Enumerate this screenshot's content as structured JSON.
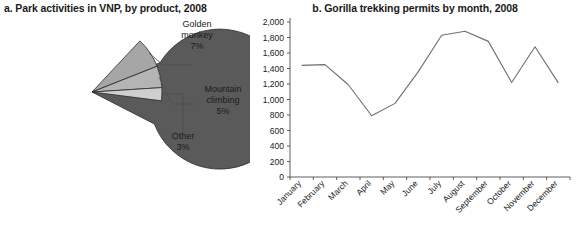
{
  "chart_data": [
    {
      "type": "pie",
      "title": "a. Park activities in VNP, by product, 2008",
      "labels": [
        "Gorilla",
        "Golden monkey",
        "Mountain climbing",
        "Other"
      ],
      "values": [
        85,
        7,
        5,
        3
      ],
      "value_labels": [
        "85%",
        "7%",
        "5%",
        "3%"
      ],
      "unit": "percent",
      "colors": [
        "#5a5a5a",
        "#a6a6a6",
        "#b4b4b4",
        "#cfcfcf"
      ],
      "legend": "none",
      "callouts": [
        {
          "label": "Golden monkey",
          "value_label": "7%"
        },
        {
          "label": "Mountain climbing",
          "value_label": "5%"
        },
        {
          "label": "Other",
          "value_label": "3%"
        }
      ],
      "inside_label": {
        "label": "Gorilla",
        "value_label": "85%"
      }
    },
    {
      "type": "line",
      "title": "b. Gorilla trekking permits by month, 2008",
      "xlabel": "",
      "ylabel": "",
      "categories": [
        "January",
        "February",
        "March",
        "April",
        "May",
        "June",
        "July",
        "August",
        "September",
        "October",
        "November",
        "December"
      ],
      "values": [
        1440,
        1450,
        1190,
        790,
        950,
        1360,
        1830,
        1880,
        1750,
        1220,
        1680,
        1215
      ],
      "ylim": [
        0,
        2000
      ],
      "ytick_step": 200,
      "ytick_labels": [
        "0",
        "200",
        "400",
        "600",
        "800",
        "1,000",
        "1,200",
        "1,400",
        "1,600",
        "1,800",
        "2,000"
      ],
      "grid": false,
      "line_color": "#6e6e6e",
      "axis_color": "#4d4d4d"
    }
  ],
  "panel_a": {
    "title": "a. Park activities in VNP, by product, 2008",
    "slices": {
      "gorilla": {
        "name": "Gorilla",
        "pct": "85%"
      },
      "golden_monkey": {
        "name_line1": "Golden",
        "name_line2": "monkey",
        "pct": "7%"
      },
      "mountain_climbing": {
        "name_line1": "Mountain",
        "name_line2": "climbing",
        "pct": "5%"
      },
      "other": {
        "name": "Other",
        "pct": "3%"
      }
    }
  },
  "panel_b": {
    "title": "b. Gorilla trekking permits by month, 2008"
  }
}
